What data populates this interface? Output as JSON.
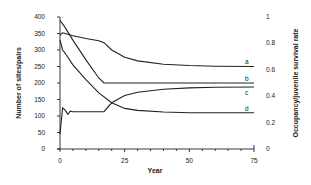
{
  "chart_data": {
    "type": "line",
    "title": "",
    "xlabel": "Year",
    "ylabel": "Number of sites/pairs",
    "ylabel_right": "Occupancy/juvenile survival rate",
    "xlim": [
      0,
      75
    ],
    "ylim": [
      0,
      400
    ],
    "ylim_right": [
      0,
      1
    ],
    "x_ticks": [
      "0",
      "25",
      "50",
      "75"
    ],
    "y_ticks": [
      "0",
      "50",
      "100",
      "150",
      "200",
      "250",
      "300",
      "350",
      "400"
    ],
    "y_ticks_right": [
      "0",
      "0.2",
      "0.4",
      "0.6",
      "0.8",
      "1"
    ],
    "grid": false,
    "legend": "inline labels at right end of curves",
    "series": [
      {
        "name": "a",
        "x": [
          0,
          1,
          2,
          5,
          10,
          15,
          17,
          20,
          25,
          30,
          40,
          50,
          60,
          75
        ],
        "values": [
          345,
          352,
          350,
          343,
          335,
          328,
          322,
          300,
          278,
          267,
          257,
          253,
          251,
          250
        ]
      },
      {
        "name": "b",
        "x": [
          0,
          2,
          5,
          10,
          15,
          17,
          20,
          30,
          50,
          75
        ],
        "values": [
          390,
          368,
          330,
          270,
          215,
          200,
          200,
          200,
          200,
          200
        ]
      },
      {
        "name": "c",
        "x": [
          0,
          1,
          2,
          5,
          10,
          15,
          20,
          25,
          30,
          40,
          50,
          75
        ],
        "values": [
          330,
          300,
          290,
          255,
          210,
          170,
          140,
          123,
          117,
          112,
          110,
          110
        ]
      },
      {
        "name": "d",
        "x": [
          0,
          1,
          2,
          3,
          4,
          5,
          10,
          17,
          20,
          25,
          30,
          40,
          50,
          60,
          75
        ],
        "values": [
          45,
          125,
          118,
          105,
          115,
          113,
          113,
          113,
          140,
          162,
          172,
          181,
          185,
          187,
          188
        ]
      }
    ]
  },
  "labels": {
    "a": "a",
    "b": "b",
    "c": "c",
    "d": "d",
    "xlabel": "Year",
    "ylabel": "Number of sites/pairs",
    "ylabel_right": "Occupancy/juvenile survival rate",
    "x0": "0",
    "x25": "25",
    "x50": "50",
    "x75": "75",
    "y0": "0",
    "y50": "50",
    "y100": "100",
    "y150": "150",
    "y200": "200",
    "y250": "250",
    "y300": "300",
    "y350": "350",
    "y400": "400",
    "r0": "0",
    "r02": "0.2",
    "r04": "0.4",
    "r06": "0.6",
    "r08": "0.8",
    "r1": "1"
  }
}
